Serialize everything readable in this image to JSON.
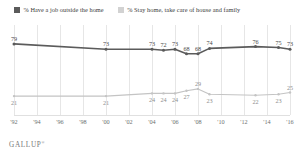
{
  "legend": {
    "items": [
      {
        "label": "% Have a job outside the home",
        "color": "#5b5b5b",
        "swatch": "dark"
      },
      {
        "label": "% Stay home, take care of house and family",
        "color": "#d2d2d2",
        "swatch": "light"
      }
    ]
  },
  "footer": {
    "brand": "GALLUP",
    "mark": "®"
  },
  "chart_data": {
    "type": "line",
    "title": "",
    "subtitle": "",
    "xlabel": "",
    "ylabel": "",
    "ylim": [
      0,
      100
    ],
    "grid": true,
    "legend_position": "top-left",
    "categories": [
      "'92",
      "'94",
      "'96",
      "'98",
      "'00",
      "'02",
      "'04",
      "'06",
      "'08",
      "'10",
      "'12",
      "'14",
      "'16"
    ],
    "x_tick_labels": [
      "'92",
      "'94",
      "'96",
      "'98",
      "'00",
      "'02",
      "'04",
      "'06",
      "'08",
      "'10",
      "'12",
      "'14",
      "'16"
    ],
    "series": [
      {
        "name": "% Have a job outside the home",
        "color": "#5b5b5b",
        "points": [
          {
            "x": "'92",
            "value": 79,
            "label": "79",
            "label_pos": "above"
          },
          {
            "x": "'00",
            "value": 73,
            "label": "73",
            "label_pos": "above"
          },
          {
            "x": "'04",
            "value": 73,
            "label": "73",
            "label_pos": "above"
          },
          {
            "x": "'05",
            "value": 72,
            "label": "72",
            "label_pos": "above"
          },
          {
            "x": "'06",
            "value": 73,
            "label": "73",
            "label_pos": "above"
          },
          {
            "x": "'07",
            "value": 68,
            "label": "68",
            "label_pos": "above"
          },
          {
            "x": "'08",
            "value": 68,
            "label": "68",
            "label_pos": "above"
          },
          {
            "x": "'09",
            "value": 74,
            "label": "74",
            "label_pos": "above"
          },
          {
            "x": "'13",
            "value": 76,
            "label": "76",
            "label_pos": "above"
          },
          {
            "x": "'15",
            "value": 75,
            "label": "75",
            "label_pos": "above"
          },
          {
            "x": "'16",
            "value": 73,
            "label": "73",
            "label_pos": "above"
          }
        ]
      },
      {
        "name": "% Stay home, take care of house and family",
        "color": "#c4c4c4",
        "points": [
          {
            "x": "'92",
            "value": 21,
            "label": "21",
            "label_pos": "below"
          },
          {
            "x": "'00",
            "value": 21,
            "label": "21",
            "label_pos": "below"
          },
          {
            "x": "'04",
            "value": 24,
            "label": "24",
            "label_pos": "below"
          },
          {
            "x": "'05",
            "value": 24,
            "label": "24",
            "label_pos": "below"
          },
          {
            "x": "'06",
            "value": 24,
            "label": "24",
            "label_pos": "below"
          },
          {
            "x": "'07",
            "value": 27,
            "label": "27",
            "label_pos": "below"
          },
          {
            "x": "'08",
            "value": 29,
            "label": "29",
            "label_pos": "above"
          },
          {
            "x": "'09",
            "value": 23,
            "label": "23",
            "label_pos": "below"
          },
          {
            "x": "'13",
            "value": 22,
            "label": "22",
            "label_pos": "below"
          },
          {
            "x": "'15",
            "value": 23,
            "label": "23",
            "label_pos": "below"
          },
          {
            "x": "'16",
            "value": 25,
            "label": "25",
            "label_pos": "above"
          }
        ]
      }
    ]
  }
}
